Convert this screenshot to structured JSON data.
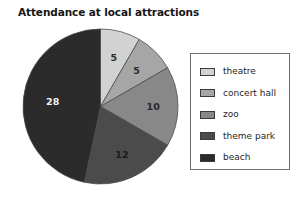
{
  "chart_data": {
    "type": "pie",
    "title": "Attendance at local attractions",
    "xlabel": "",
    "ylabel": "",
    "legend_position": "right",
    "grid": false,
    "total": 60,
    "categories": [
      "theatre",
      "concert hall",
      "zoo",
      "theme park",
      "beach"
    ],
    "values": [
      5,
      5,
      10,
      12,
      28
    ],
    "value_labels": [
      "5",
      "5",
      "10",
      "12",
      "28"
    ],
    "colors": [
      "#d2d2d2",
      "#a6a6a6",
      "#888888",
      "#4b4b4b",
      "#2b2b2b"
    ],
    "label_text_colors": [
      "#2a2a2a",
      "#2a2a2a",
      "#2a2a2a",
      "#1a1a1a",
      "#f2f2f2"
    ],
    "start_angle_deg": 0,
    "direction": "clockwise",
    "slices": [
      {
        "name": "theatre",
        "value": 5,
        "label": "5",
        "color": "#d2d2d2",
        "sweep_deg": 30
      },
      {
        "name": "concert hall",
        "value": 5,
        "label": "5",
        "color": "#a6a6a6",
        "sweep_deg": 30
      },
      {
        "name": "zoo",
        "value": 10,
        "label": "10",
        "color": "#888888",
        "sweep_deg": 60
      },
      {
        "name": "theme park",
        "value": 12,
        "label": "12",
        "color": "#4b4b4b",
        "sweep_deg": 72
      },
      {
        "name": "beach",
        "value": 28,
        "label": "28",
        "color": "#2b2b2b",
        "sweep_deg": 168
      }
    ]
  },
  "title": {
    "text": "Attendance at local attractions"
  },
  "pie": {
    "labels": {
      "theatre": "5",
      "concert_hall": "5",
      "zoo": "10",
      "theme_park": "12",
      "beach": "28"
    }
  },
  "legend": {
    "items": [
      {
        "label": "theatre",
        "color": "#d2d2d2"
      },
      {
        "label": "concert hall",
        "color": "#a6a6a6"
      },
      {
        "label": "zoo",
        "color": "#888888"
      },
      {
        "label": "theme park",
        "color": "#4b4b4b"
      },
      {
        "label": "beach",
        "color": "#2b2b2b"
      }
    ]
  }
}
